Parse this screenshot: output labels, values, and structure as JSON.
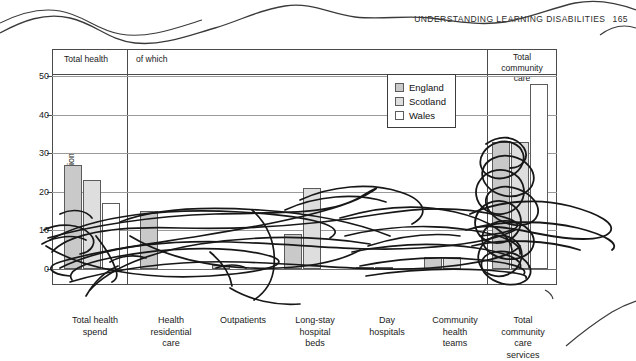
{
  "page": {
    "running_head": "UNDERSTANDING LEARNING DISABILITIES",
    "page_number": "165"
  },
  "figure": {
    "header_cells": [
      {
        "label": "Total health"
      },
      {
        "label": "of which"
      },
      {
        "label": "Total\ncommunity\ncare"
      }
    ],
    "header_cell_1": "Total health",
    "header_cell_2": "of which",
    "header_cell_3_line1": "Total",
    "header_cell_3_line2": "community",
    "header_cell_3_line3": "care"
  },
  "legend": {
    "position": "top-right-inside",
    "items": [
      {
        "label": "England",
        "color": "#c9c9c9"
      },
      {
        "label": "Scotland",
        "color": "#dedede"
      },
      {
        "label": "Wales",
        "color": "#ffffff"
      }
    ],
    "item_0": "England",
    "item_1": "Scotland",
    "item_2": "Wales"
  },
  "chart_data": {
    "type": "bar",
    "title": "",
    "subtitle": "",
    "xlabel": "",
    "ylabel": "£ per head of the population",
    "ylim": [
      0,
      55
    ],
    "yticks": [
      0,
      10,
      20,
      30,
      40,
      50
    ],
    "ytick_labels": [
      "0",
      "10",
      "20",
      "30",
      "40",
      "50"
    ],
    "grid": "horizontal",
    "legend_position": "inside top-right",
    "categories": [
      "Total health spend",
      "Health residential care",
      "Outpatients",
      "Long-stay hospital beds",
      "Day hospitals",
      "Community health teams",
      "Total community care services"
    ],
    "category_label_lines": [
      [
        "Total health",
        "spend"
      ],
      [
        "Health",
        "residential",
        "care"
      ],
      [
        "Outpatients"
      ],
      [
        "Long-stay",
        "hospital",
        "beds"
      ],
      [
        "Day",
        "hospitals"
      ],
      [
        "Community",
        "health",
        "teams"
      ],
      [
        "Total",
        "community",
        "care",
        "services"
      ]
    ],
    "series": [
      {
        "name": "England",
        "color": "#c9c9c9",
        "values": [
          27,
          15,
          1,
          9,
          0.5,
          3,
          33
        ]
      },
      {
        "name": "Scotland",
        "color": "#dedede",
        "values": [
          23,
          0,
          0,
          21,
          0.5,
          3,
          33
        ]
      },
      {
        "name": "Wales",
        "color": "#ffffff",
        "values": [
          17,
          0,
          0,
          0,
          0,
          0,
          48
        ]
      }
    ]
  }
}
